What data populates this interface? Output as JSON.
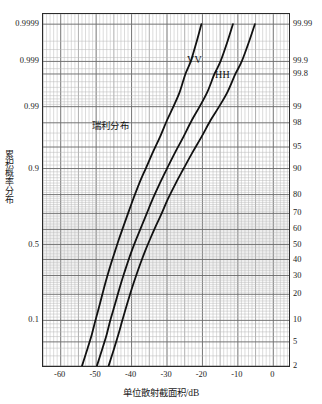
{
  "chart_data": {
    "type": "line",
    "title": "",
    "xlabel": "单位散射截面积/dB",
    "ylabel": "累积概率分布",
    "xlim": [
      -65,
      5
    ],
    "xticks": [
      -60,
      -50,
      -40,
      -30,
      -20,
      -10,
      0
    ],
    "xtick_labels": [
      "-60",
      "-50",
      "-40",
      "-30",
      "-20",
      "-10",
      "0"
    ],
    "x_minor_step": 1,
    "grid": true,
    "grid_type": "probability-paper",
    "legend_position": "inline-annotations",
    "y_axis_left": {
      "label": "累积概率分布",
      "scale": "normal-probability",
      "ticks": [
        0.9999,
        0.999,
        0.99,
        0.9,
        0.5,
        0.1
      ],
      "tick_labels": [
        "0.9999",
        "0.999",
        "0.99",
        "0.9",
        "0.5",
        "0.1"
      ]
    },
    "y_axis_right": {
      "scale": "normal-probability-percent",
      "ticks": [
        99.99,
        99.9,
        99.8,
        99,
        98,
        95,
        90,
        80,
        70,
        60,
        50,
        40,
        30,
        20,
        10,
        5,
        2
      ],
      "tick_labels": [
        "99.99",
        "99.9",
        "99.8",
        "99",
        "98",
        "95",
        "90",
        "80",
        "70",
        "60",
        "50",
        "40",
        "30",
        "20",
        "10",
        "5",
        "2"
      ]
    },
    "annotations": [
      {
        "name": "rayleigh-label",
        "text": "瑞利分布",
        "x": -38,
        "y_percent": 93
      },
      {
        "name": "vv-label",
        "text": "VV",
        "x": -26.5,
        "y_percent": 99.6
      },
      {
        "name": "hh-label",
        "text": "HH",
        "x": -18.5,
        "y_percent": 99.4
      }
    ],
    "series": [
      {
        "name": "瑞利分布",
        "color": "#111111",
        "points": [
          [
            -54.0,
            2.0
          ],
          [
            -52.4,
            4.0
          ],
          [
            -51.2,
            6.5
          ],
          [
            -50.2,
            10.0
          ],
          [
            -48.9,
            16.0
          ],
          [
            -47.8,
            23.0
          ],
          [
            -46.8,
            30.0
          ],
          [
            -45.7,
            38.0
          ],
          [
            -44.6,
            46.0
          ],
          [
            -43.5,
            54.0
          ],
          [
            -42.3,
            62.0
          ],
          [
            -41.0,
            70.0
          ],
          [
            -39.5,
            78.0
          ],
          [
            -37.8,
            85.0
          ],
          [
            -36.0,
            90.0
          ],
          [
            -34.0,
            94.0
          ],
          [
            -32.0,
            96.5
          ],
          [
            -30.0,
            98.2
          ],
          [
            -28.2,
            99.0
          ],
          [
            -26.4,
            99.5
          ],
          [
            -24.8,
            99.8
          ],
          [
            -23.3,
            99.9
          ],
          [
            -21.6,
            99.97
          ],
          [
            -20.3,
            99.99
          ]
        ]
      },
      {
        "name": "VV",
        "color": "#111111",
        "points": [
          [
            -49.8,
            2.0
          ],
          [
            -48.2,
            4.0
          ],
          [
            -47.0,
            6.5
          ],
          [
            -46.0,
            10.0
          ],
          [
            -44.6,
            16.0
          ],
          [
            -43.4,
            23.0
          ],
          [
            -42.3,
            30.0
          ],
          [
            -41.1,
            38.0
          ],
          [
            -39.9,
            46.0
          ],
          [
            -38.6,
            54.0
          ],
          [
            -37.2,
            62.0
          ],
          [
            -35.7,
            70.0
          ],
          [
            -34.0,
            78.0
          ],
          [
            -32.0,
            85.0
          ],
          [
            -30.0,
            90.0
          ],
          [
            -27.7,
            94.0
          ],
          [
            -25.4,
            96.5
          ],
          [
            -23.0,
            98.2
          ],
          [
            -20.8,
            99.0
          ],
          [
            -18.6,
            99.5
          ],
          [
            -16.6,
            99.8
          ],
          [
            -14.9,
            99.9
          ],
          [
            -12.9,
            99.97
          ],
          [
            -11.4,
            99.99
          ]
        ]
      },
      {
        "name": "HH",
        "color": "#111111",
        "points": [
          [
            -46.5,
            2.0
          ],
          [
            -44.9,
            4.0
          ],
          [
            -43.7,
            6.5
          ],
          [
            -42.6,
            10.0
          ],
          [
            -41.2,
            16.0
          ],
          [
            -39.9,
            23.0
          ],
          [
            -38.7,
            30.0
          ],
          [
            -37.4,
            38.0
          ],
          [
            -36.1,
            46.0
          ],
          [
            -34.7,
            54.0
          ],
          [
            -33.2,
            62.0
          ],
          [
            -31.5,
            70.0
          ],
          [
            -29.7,
            78.0
          ],
          [
            -27.5,
            85.0
          ],
          [
            -25.3,
            90.0
          ],
          [
            -22.8,
            94.0
          ],
          [
            -20.3,
            96.5
          ],
          [
            -17.7,
            98.2
          ],
          [
            -15.3,
            99.0
          ],
          [
            -12.9,
            99.5
          ],
          [
            -10.7,
            99.8
          ],
          [
            -8.9,
            99.9
          ],
          [
            -6.8,
            99.97
          ],
          [
            -5.2,
            99.99
          ]
        ]
      }
    ]
  },
  "colors": {
    "frame": "#2b2b2b",
    "grid_minor": "#b9b9b9",
    "grid_major": "#6e6e6e",
    "curve": "#111111",
    "background": "#ffffff",
    "text": "#1a1a1a"
  }
}
